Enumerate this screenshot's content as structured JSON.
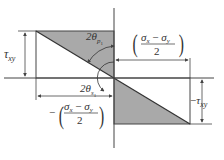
{
  "diagram": {
    "labels": {
      "tau_xy_left": {
        "symbol": "τ",
        "sub": "xy"
      },
      "tau_xy_right": {
        "prefix": "−",
        "symbol": "τ",
        "sub": "xy"
      },
      "angle_p1": {
        "prefix": "2θ",
        "sub": "p",
        "subsub": "1"
      },
      "angle_s1": {
        "prefix": "2θ",
        "sub": "s",
        "subsub": "1"
      },
      "pos_half_diff": {
        "numerator_a": "σ",
        "numerator_a_sub": "x",
        "minus": " − ",
        "numerator_b": "σ",
        "numerator_b_sub": "y",
        "denominator": "2",
        "sign": ""
      },
      "neg_half_diff": {
        "numerator_a": "σ",
        "numerator_a_sub": "x",
        "minus": " − ",
        "numerator_b": "σ",
        "numerator_b_sub": "y",
        "denominator": "2",
        "sign": "−"
      }
    },
    "colors": {
      "shade": "#a9a9a9",
      "line": "#444444",
      "text": "#333333"
    }
  }
}
